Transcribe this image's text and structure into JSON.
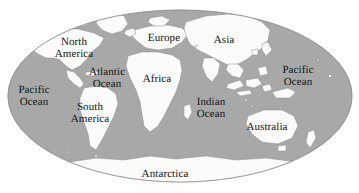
{
  "map": {
    "type": "world-map",
    "projection": "elliptical (Mollweide-style)",
    "colors": {
      "background": "#ffffff",
      "ocean": "#a8a8a8",
      "land": "#fbfbfb",
      "coastline": "#8d8d8d",
      "label_text": "#141414"
    },
    "ellipse": {
      "center_x": 180,
      "center_y": 96,
      "radius_x": 172,
      "radius_y": 86
    },
    "labels": [
      {
        "name": "north-america",
        "text": "North\nAmerica",
        "x": 74,
        "y": 48
      },
      {
        "name": "europe",
        "text": "Europe",
        "x": 164,
        "y": 39
      },
      {
        "name": "asia",
        "text": "Asia",
        "x": 224,
        "y": 41
      },
      {
        "name": "pacific-ocean-east",
        "text": "Pacific\nOcean",
        "x": 298,
        "y": 76
      },
      {
        "name": "atlantic-ocean",
        "text": "Atlantic\nOcean",
        "x": 107,
        "y": 78
      },
      {
        "name": "africa",
        "text": "Africa",
        "x": 157,
        "y": 80
      },
      {
        "name": "pacific-ocean-west",
        "text": "Pacific\nOcean",
        "x": 34,
        "y": 96
      },
      {
        "name": "south-america",
        "text": "South\nAmerica",
        "x": 90,
        "y": 113
      },
      {
        "name": "indian-ocean",
        "text": "Indian\nOcean",
        "x": 211,
        "y": 108
      },
      {
        "name": "australia",
        "text": "Australia",
        "x": 267,
        "y": 128
      },
      {
        "name": "antarctica",
        "text": "Antarctica",
        "x": 165,
        "y": 175
      }
    ]
  }
}
